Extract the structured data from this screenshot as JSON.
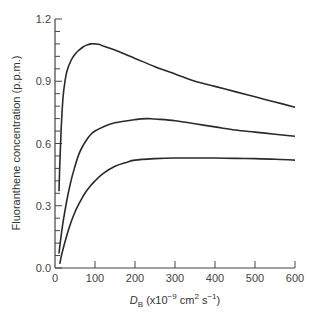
{
  "chart_data": {
    "type": "line",
    "title": "",
    "xlabel": "D_B (x10^-9 cm^2 s^-1)",
    "xlabel_parts": {
      "main": "D",
      "sub": "B",
      "rest_open": " (x10",
      "exp1": "−9",
      "mid": " cm",
      "exp2": "2",
      "mid2": " s",
      "exp3": "−1",
      "close": ")"
    },
    "ylabel": "Fluoranthene concentration (p.p.m.)",
    "xlim": [
      0,
      600
    ],
    "ylim": [
      0,
      1.2
    ],
    "x_ticks": [
      0,
      100,
      200,
      300,
      400,
      500,
      600
    ],
    "x_tick_labels": [
      "0",
      "100",
      "200",
      "300",
      "400",
      "500",
      "600"
    ],
    "y_ticks": [
      0.0,
      0.3,
      0.6,
      0.9,
      1.2
    ],
    "y_tick_labels": [
      "0.0",
      "0.3",
      "0.6",
      "0.9",
      "1.2"
    ],
    "y_minor_step": 0.06,
    "grid": false,
    "legend": null,
    "series": [
      {
        "name": "upper curve",
        "x": [
          10,
          12,
          15,
          20,
          25,
          30,
          40,
          50,
          60,
          70,
          80,
          90,
          100,
          110,
          120,
          150,
          200,
          250,
          300,
          350,
          400,
          450,
          500,
          550,
          600
        ],
        "y": [
          0.37,
          0.5,
          0.65,
          0.82,
          0.9,
          0.95,
          1.0,
          1.03,
          1.05,
          1.065,
          1.075,
          1.08,
          1.08,
          1.078,
          1.07,
          1.05,
          1.01,
          0.97,
          0.935,
          0.9,
          0.875,
          0.85,
          0.825,
          0.8,
          0.775
        ]
      },
      {
        "name": "middle curve",
        "x": [
          10,
          15,
          20,
          30,
          40,
          50,
          60,
          70,
          80,
          90,
          100,
          120,
          150,
          200,
          230,
          250,
          300,
          350,
          400,
          450,
          500,
          550,
          600
        ],
        "y": [
          0.07,
          0.15,
          0.22,
          0.33,
          0.42,
          0.49,
          0.55,
          0.59,
          0.62,
          0.645,
          0.66,
          0.68,
          0.7,
          0.715,
          0.72,
          0.718,
          0.71,
          0.695,
          0.68,
          0.665,
          0.655,
          0.645,
          0.635
        ]
      },
      {
        "name": "lower curve",
        "x": [
          12,
          15,
          20,
          30,
          40,
          50,
          60,
          70,
          80,
          100,
          120,
          150,
          180,
          200,
          250,
          300,
          350,
          400,
          450,
          500,
          550,
          600
        ],
        "y": [
          0.02,
          0.05,
          0.09,
          0.16,
          0.22,
          0.27,
          0.31,
          0.345,
          0.375,
          0.42,
          0.455,
          0.49,
          0.51,
          0.52,
          0.527,
          0.53,
          0.53,
          0.53,
          0.528,
          0.527,
          0.524,
          0.52
        ]
      }
    ]
  },
  "style": {
    "line_color": "#2a2a2a",
    "axis_color": "#444444",
    "background": "#ffffff"
  }
}
